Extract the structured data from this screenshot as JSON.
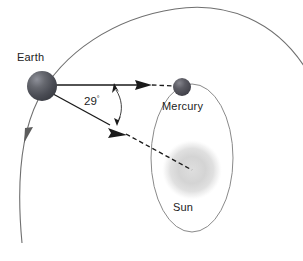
{
  "diagram": {
    "background_color": "#ffffff",
    "width": 303,
    "height": 261
  },
  "bodies": {
    "earth": {
      "label": "Earth",
      "color": "#4d4f58",
      "highlight_color": "#8b8d95",
      "center": {
        "x": 42,
        "y": 86
      },
      "radius": 15
    },
    "mercury": {
      "label": "Mercury",
      "color": "#4a4a52",
      "highlight_color": "#84848c",
      "center": {
        "x": 182,
        "y": 87
      },
      "radius": 9
    },
    "sun": {
      "label": "Sun",
      "color": "#c9c9c9",
      "highlight_color": "#e3e3e3",
      "center": {
        "x": 192,
        "y": 170
      },
      "radius": 26
    }
  },
  "orbits": {
    "earth_orbit": {
      "name": "earth-orbit-arc",
      "color": "#6f6f6f",
      "direction_arrow": "counterclockwise"
    },
    "mercury_orbit": {
      "name": "mercury-orbit-ellipse",
      "color": "#8a8a8a",
      "center": {
        "x": 192,
        "y": 158
      },
      "rx": 41,
      "ry": 74
    }
  },
  "angle": {
    "value": "29",
    "degree_symbol": "°",
    "full_label": "29°",
    "description": "angle between line of sight to Mercury and line of sight to the Sun"
  },
  "sight_lines": {
    "to_mercury": {
      "name": "earth-to-mercury-line",
      "style": "solid-then-dashed",
      "color": "#1a1a1a"
    },
    "to_sun": {
      "name": "earth-to-sun-line",
      "style": "solid-then-dashed",
      "color": "#1a1a1a"
    }
  }
}
